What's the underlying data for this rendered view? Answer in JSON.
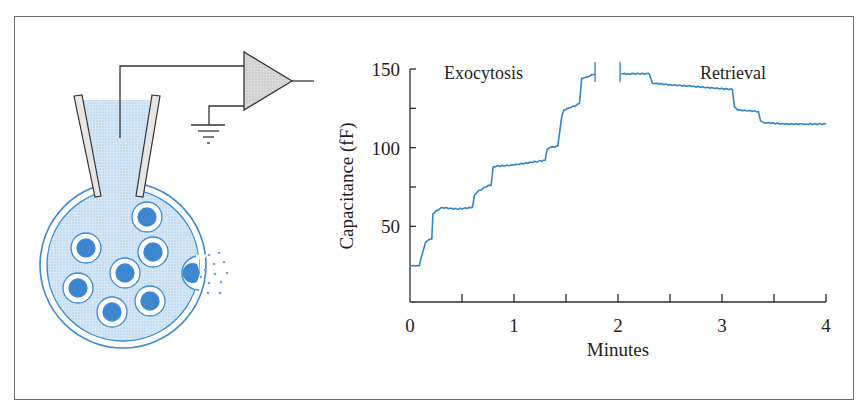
{
  "figure": {
    "diagram": {
      "title": "Patch-clamp capacitance measurement of a cell",
      "components": [
        "pipette",
        "electrode-wire",
        "amplifier",
        "ground",
        "cell",
        "secretory-vesicles",
        "fusing-vesicle",
        "released-contents"
      ],
      "vesicle_count": 7
    },
    "colors": {
      "trace": "#2f86cf",
      "cell_stroke": "#3a8ad4",
      "cell_fill": "#cfe2f3",
      "vesicle_fill": "#3f86d0",
      "amplifier_fill": "#d4d4d4",
      "axis": "#2a2a2a",
      "frame": "#6e6e6e"
    }
  },
  "chart_data": {
    "type": "line",
    "title": "",
    "xlabel": "Minutes",
    "ylabel": "Capacitance (fF)",
    "xlim": [
      0,
      4
    ],
    "ylim": [
      0,
      150
    ],
    "x_ticks": [
      0,
      0.5,
      1,
      1.5,
      2,
      2.5,
      3,
      3.5,
      4
    ],
    "x_tick_labels": [
      "0",
      "1",
      "2",
      "3",
      "4"
    ],
    "y_ticks": [
      50,
      75,
      100,
      125,
      150
    ],
    "y_tick_labels": [
      "50",
      "100",
      "150"
    ],
    "grid": false,
    "legend": null,
    "annotations": [
      {
        "text": "Exocytosis",
        "x": 0.55,
        "y": 148
      },
      {
        "text": "Retrieval",
        "x": 3.15,
        "y": 148
      }
    ],
    "series": [
      {
        "name": "Exocytosis",
        "x": [
          0.0,
          0.09,
          0.12,
          0.15,
          0.17,
          0.21,
          0.22,
          0.3,
          0.45,
          0.6,
          0.62,
          0.65,
          0.75,
          0.78,
          0.8,
          1.0,
          1.3,
          1.32,
          1.34,
          1.42,
          1.46,
          1.48,
          1.6,
          1.63,
          1.65,
          1.7,
          1.78
        ],
        "y": [
          25,
          25,
          33,
          40,
          41,
          42,
          58,
          62,
          61,
          62,
          70,
          72,
          76,
          76,
          88,
          89,
          92,
          99,
          100,
          101,
          120,
          124,
          127,
          128,
          144,
          145,
          147
        ]
      },
      {
        "name": "Retrieval",
        "x": [
          2.03,
          2.1,
          2.3,
          2.33,
          2.5,
          2.7,
          3.1,
          3.12,
          3.15,
          3.35,
          3.37,
          3.4,
          3.6,
          3.8,
          4.0
        ],
        "y": [
          147,
          147,
          147,
          141,
          140,
          139,
          137,
          126,
          124,
          123,
          117,
          116,
          115,
          115,
          115
        ]
      }
    ],
    "gap_markers_minutes": [
      1.78,
      2.02
    ]
  }
}
